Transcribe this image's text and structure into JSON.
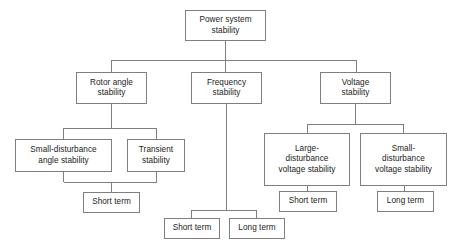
{
  "diagram": {
    "type": "hierarchy-tree",
    "colors": {
      "box_border": "#7f7f7f",
      "box_fill": "#ffffff",
      "line": "#7f7f7f",
      "text": "#1a1a1a",
      "background": "#ffffff"
    },
    "nodes": [
      {
        "id": "power-system-stability",
        "label": "Power system\nstability",
        "level": 0,
        "x": 185,
        "y": 10,
        "w": 81,
        "h": 31
      },
      {
        "id": "rotor-angle-stability",
        "label": "Rotor angle\nstability",
        "level": 1,
        "x": 76,
        "y": 72,
        "w": 71,
        "h": 32
      },
      {
        "id": "frequency-stability",
        "label": "Frequency\nstability",
        "level": 1,
        "x": 191,
        "y": 72,
        "w": 71,
        "h": 32
      },
      {
        "id": "voltage-stability",
        "label": "Voltage\nstability",
        "level": 1,
        "x": 320,
        "y": 72,
        "w": 71,
        "h": 32
      },
      {
        "id": "small-disturbance-angle-stability",
        "label": "Small-disturbance\nangle stability",
        "level": 2,
        "x": 15,
        "y": 139,
        "w": 97,
        "h": 33
      },
      {
        "id": "transient-stability",
        "label": "Transient\nstability",
        "level": 2,
        "x": 127,
        "y": 139,
        "w": 58,
        "h": 33
      },
      {
        "id": "large-disturbance-voltage-stability",
        "label": "Large-\ndisturbance\nvoltage stability",
        "level": 2,
        "x": 264,
        "y": 133,
        "w": 86,
        "h": 53
      },
      {
        "id": "small-disturbance-voltage-stability",
        "label": "Small-\ndisturbance\nvoltage stability",
        "level": 2,
        "x": 360,
        "y": 133,
        "w": 87,
        "h": 53
      },
      {
        "id": "angle-short-term",
        "label": "Short term",
        "level": 3,
        "x": 83,
        "y": 192,
        "w": 57,
        "h": 21
      },
      {
        "id": "frequency-short-term",
        "label": "Short term",
        "level": 3,
        "x": 164,
        "y": 218,
        "w": 56,
        "h": 21
      },
      {
        "id": "frequency-long-term",
        "label": "Long term",
        "level": 3,
        "x": 229,
        "y": 218,
        "w": 56,
        "h": 21
      },
      {
        "id": "large-disturbance-short-term",
        "label": "Short term",
        "level": 3,
        "x": 279,
        "y": 191,
        "w": 58,
        "h": 21
      },
      {
        "id": "small-disturbance-long-term",
        "label": "Long term",
        "level": 3,
        "x": 377,
        "y": 191,
        "w": 57,
        "h": 21
      }
    ],
    "edges": [
      {
        "from": "power-system-stability",
        "to": "rotor-angle-stability"
      },
      {
        "from": "power-system-stability",
        "to": "frequency-stability"
      },
      {
        "from": "power-system-stability",
        "to": "voltage-stability"
      },
      {
        "from": "rotor-angle-stability",
        "to": "small-disturbance-angle-stability"
      },
      {
        "from": "rotor-angle-stability",
        "to": "transient-stability"
      },
      {
        "from": "small-disturbance-angle-stability",
        "to": "angle-short-term"
      },
      {
        "from": "transient-stability",
        "to": "angle-short-term"
      },
      {
        "from": "frequency-stability",
        "to": "frequency-short-term"
      },
      {
        "from": "frequency-stability",
        "to": "frequency-long-term"
      },
      {
        "from": "voltage-stability",
        "to": "large-disturbance-voltage-stability"
      },
      {
        "from": "voltage-stability",
        "to": "small-disturbance-voltage-stability"
      },
      {
        "from": "large-disturbance-voltage-stability",
        "to": "large-disturbance-short-term"
      },
      {
        "from": "small-disturbance-voltage-stability",
        "to": "small-disturbance-long-term"
      }
    ],
    "connector_paths": [
      "M225.5 41 L225.5 60",
      "M111.5 60 L356.5 60",
      "M111.5 60 L111.5 72",
      "M225.5 60 L225.5 72",
      "M356.5 60 L356.5 72",
      "M111.5 104 L111.5 128",
      "M63.5 128 L156.5 128",
      "M63.5 128 L63.5 139",
      "M156.5 128 L156.5 139",
      "M63.5 172 L63.5 182",
      "M156.5 172 L156.5 182",
      "M63.5 182 L156.5 182",
      "M111.5 182 L111.5 192",
      "M226.5 104 L226.5 210",
      "M191.5 210 L256.5 210",
      "M191.5 210 L191.5 218",
      "M256.5 210 L256.5 218",
      "M355.5 104 L355.5 124",
      "M307.5 124 L403.5 124",
      "M307.5 124 L307.5 133",
      "M403.5 124 L403.5 133",
      "M307.5 186 L307.5 191",
      "M404.5 186 L404.5 191"
    ]
  }
}
